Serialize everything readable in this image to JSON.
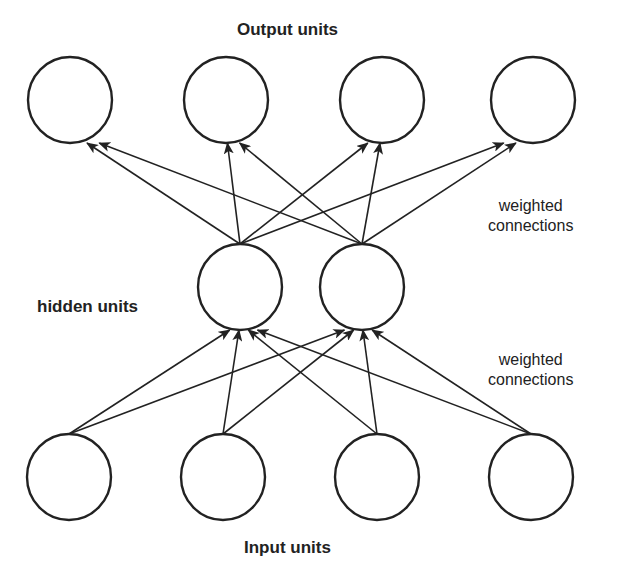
{
  "labels": {
    "output": "Output units",
    "hidden": "hidden units",
    "input": "Input units",
    "weights_top_line1": "weighted",
    "weights_top_line2": "connections",
    "weights_bottom_line1": "weighted",
    "weights_bottom_line2": "connections"
  },
  "layers": {
    "output": {
      "count": 4,
      "y": 100,
      "x": [
        70,
        226,
        382,
        533
      ]
    },
    "hidden": {
      "count": 2,
      "y": 287,
      "x": [
        240,
        362
      ]
    },
    "input": {
      "count": 4,
      "y": 477,
      "x": [
        69,
        223,
        377,
        531
      ]
    }
  },
  "colors": {
    "stroke": "#222222",
    "background": "#ffffff"
  }
}
